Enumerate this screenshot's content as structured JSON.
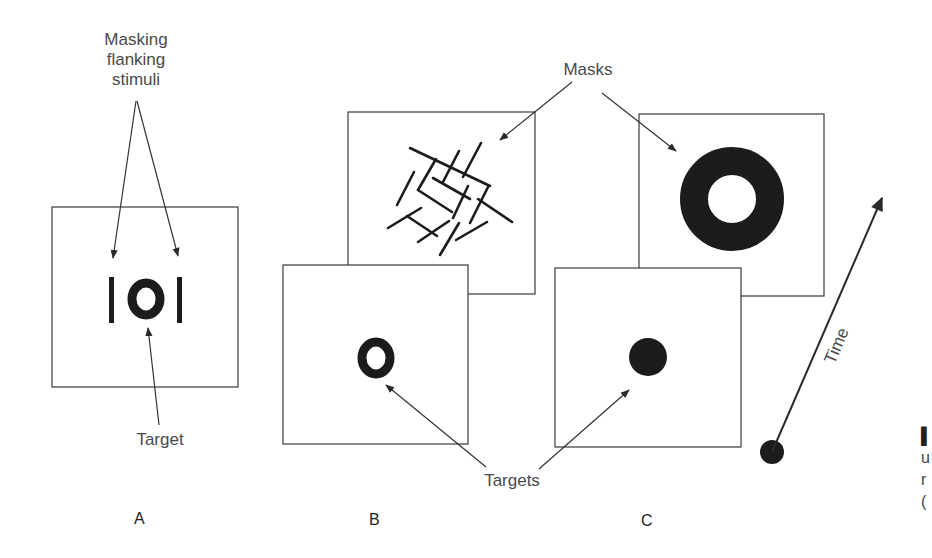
{
  "callouts": {
    "masking_flanking": [
      "Masking",
      "flanking",
      "stimuli"
    ],
    "target": "Target",
    "masks": "Masks",
    "targets": "Targets",
    "time": "Time"
  },
  "panels": [
    {
      "letter": "A",
      "description": "Target O flanked by two vertical bars (metacontrast-like flanking masks)"
    },
    {
      "letter": "B",
      "description": "Target O followed in time by a random-line noise mask"
    },
    {
      "letter": "C",
      "description": "Target disc followed in time by a surrounding ring (annulus) mask"
    }
  ],
  "caption_fragment": [
    "▌",
    "u",
    "r",
    "("
  ],
  "colors": {
    "stroke": "#3a3a3a",
    "fill_dark": "#1c1c1c",
    "text": "#4a4a4a"
  }
}
